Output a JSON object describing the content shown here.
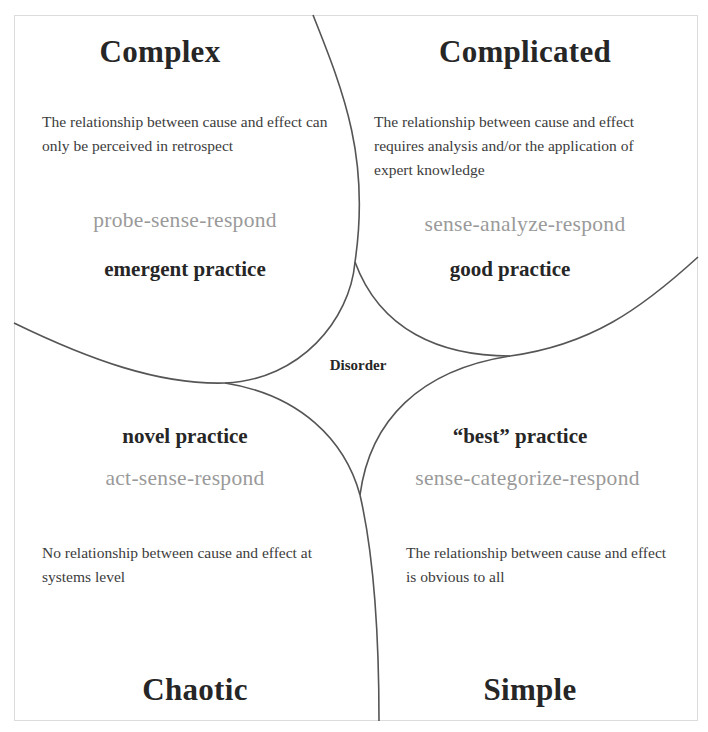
{
  "diagram": {
    "center_label": "Disorder",
    "domains": [
      {
        "id": "complex",
        "title": "Complex",
        "description": "The relationship between cause and effect can only be perceived in retrospect",
        "approach": "probe-sense-respond",
        "practice": "emergent practice"
      },
      {
        "id": "complicated",
        "title": "Complicated",
        "description": "The relationship between cause and effect requires analysis and/or the application of expert knowledge",
        "approach": "sense-analyze-respond",
        "practice": "good practice"
      },
      {
        "id": "chaotic",
        "title": "Chaotic",
        "description": "No relationship between cause and effect at systems level",
        "approach": "act-sense-respond",
        "practice": "novel practice"
      },
      {
        "id": "simple",
        "title": "Simple",
        "description": "The relationship between cause and effect is obvious to all",
        "approach": "sense-categorize-respond",
        "practice": "“best” practice"
      }
    ],
    "colors": {
      "title": "#262626",
      "description": "#3c3c3c",
      "approach": "#9a9a9a",
      "line": "#555555",
      "frame": "#dcdcdc"
    }
  }
}
